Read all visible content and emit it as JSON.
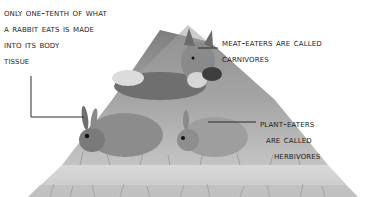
{
  "diagram": {
    "type": "food-pyramid-illustration",
    "colors": {
      "background": "#ffffff",
      "text": "#1e1e1e",
      "leader_line": "#2a2a2a",
      "top_tier": "#9a9a9a",
      "middle_tier": "#b8b8b8",
      "bottom_tier": "#d2d2d2"
    },
    "tiers": [
      {
        "level": "top",
        "subject": "fox eating a bird",
        "role": "carnivore"
      },
      {
        "level": "middle",
        "subject": "rabbits eating grass",
        "role": "herbivore"
      },
      {
        "level": "bottom",
        "subject": "grass / plants",
        "role": "producer"
      }
    ],
    "labels": {
      "rabbit_energy": {
        "lines": [
          "Only one-tenth of what",
          "a rabbit eats is made",
          "into its body",
          "tissue"
        ]
      },
      "meat_eaters": {
        "lines": [
          "Meat-eaters are called",
          "carnivores"
        ]
      },
      "plant_eaters": {
        "lines": [
          "Plant-eaters",
          "are called",
          "herbivores"
        ]
      }
    }
  }
}
